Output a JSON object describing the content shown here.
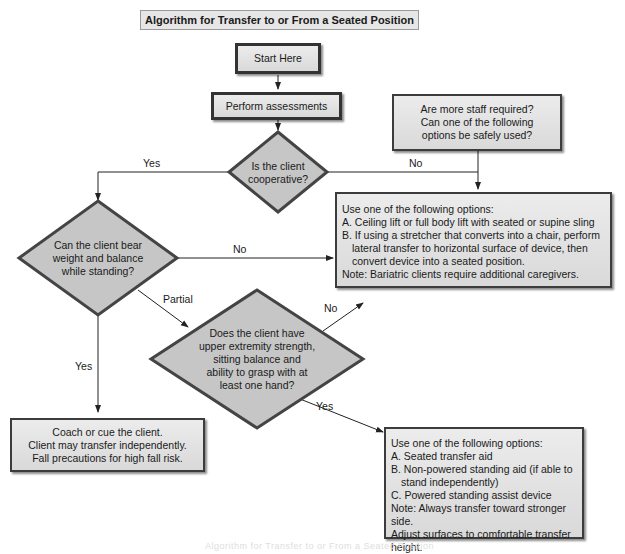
{
  "title": "Algorithm for Transfer to or From a Seated Position",
  "nodes": {
    "start": {
      "text": "Start Here"
    },
    "assess": {
      "text": "Perform assessments"
    },
    "staff": {
      "lines": [
        "Are more staff required?",
        "Can one of the following",
        "options be safely used?"
      ]
    },
    "cooperative": {
      "lines": [
        "Is the client",
        "cooperative?"
      ]
    },
    "lift_options": {
      "lines": [
        "Use one of the following options:",
        "A. Ceiling lift or full body lift with seated or supine sling",
        "B. If using a stretcher that converts into a chair, perform",
        "lateral transfer to horizontal surface of device, then",
        "convert device into a seated position.",
        "Note: Bariatric clients require additional caregivers."
      ]
    },
    "bear_weight": {
      "lines": [
        "Can the client bear",
        "weight and balance",
        "while standing?"
      ]
    },
    "upper_strength": {
      "lines": [
        "Does the client have",
        "upper extremity strength,",
        "sitting balance and",
        "ability to grasp with at",
        "least one hand?"
      ]
    },
    "coach": {
      "lines": [
        "Coach or cue the client.",
        "Client may transfer independently.",
        "Fall precautions for high fall risk."
      ]
    },
    "aid_options": {
      "lines": [
        "Use one of the following options:",
        "A. Seated transfer aid",
        "B. Non-powered standing aid (if able to",
        "stand independently)",
        "C. Powered standing assist device",
        "Note: Always transfer toward stronger side.",
        "Adjust surfaces to comfortable transfer height.",
        "Bariatric clients require additional caregiver"
      ]
    }
  },
  "edges": {
    "coop_yes": "Yes",
    "coop_no": "No",
    "bear_no": "No",
    "bear_partial": "Partial",
    "bear_yes": "Yes",
    "upper_no": "No",
    "upper_yes": "Yes"
  },
  "caption": "Algorithm for Transfer to or From a Seated Position",
  "colors": {
    "box_fill": "#e0e0e0",
    "diamond_fill": "#c4c4c4",
    "border": "#333333",
    "line": "#222222"
  }
}
